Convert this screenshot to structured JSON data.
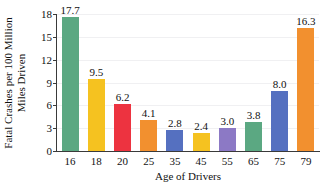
{
  "chart_data": {
    "type": "bar",
    "title": "",
    "xlabel": "Age of Drivers",
    "ylabel_lines": [
      "Fatal Crashes per 100 Million",
      "Miles Driven"
    ],
    "categories": [
      "16",
      "18",
      "20",
      "25",
      "35",
      "45",
      "55",
      "65",
      "75",
      "79"
    ],
    "values": [
      17.7,
      9.5,
      6.2,
      4.1,
      2.8,
      2.4,
      3.0,
      3.8,
      8.0,
      16.3
    ],
    "value_labels": [
      "17.7",
      "9.5",
      "6.2",
      "4.1",
      "2.8",
      "2.4",
      "3.0",
      "3.8",
      "8.0",
      "16.3"
    ],
    "bar_colors": [
      "#5BA882",
      "#F5C220",
      "#ED3340",
      "#F2902F",
      "#5570C0",
      "#F5C220",
      "#8C79C5",
      "#5BA882",
      "#5570C0",
      "#F2902F"
    ],
    "ylim": [
      0,
      18
    ],
    "yticks": [
      0,
      3,
      6,
      9,
      12,
      15,
      18
    ],
    "ytick_labels": [
      "0",
      "3",
      "6",
      "9",
      "12",
      "15",
      "18"
    ],
    "grid": true,
    "legend": "none"
  }
}
